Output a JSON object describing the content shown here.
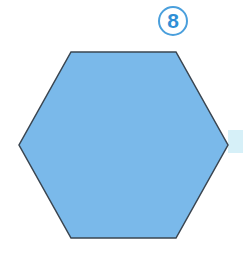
{
  "badge": {
    "number": "8"
  },
  "shape": {
    "type": "hexagon",
    "fill": "#7ab9ea",
    "stroke": "#3a4550",
    "points": "71,52 176,52 228,145 176,238 71,238 19,145"
  },
  "accent_strip": {
    "color": "#d6f0f8"
  }
}
